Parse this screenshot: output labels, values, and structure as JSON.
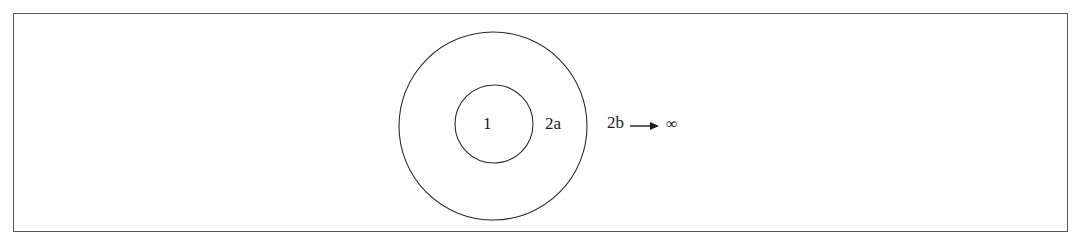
{
  "figure": {
    "type": "concentric-circles-diagram",
    "caption": "",
    "border_color": "#585858",
    "stroke_color": "#2a2a2a",
    "background_color": "#ffffff",
    "text_color": "#1b1b1b"
  },
  "labels": {
    "inner_circle": "1",
    "annulus": "2a",
    "outside": "2b",
    "arrow_icon": "rightwards-arrow",
    "limit": "∞"
  },
  "chart_data": {
    "type": "diagram",
    "title": "",
    "shapes": [
      {
        "name": "inner-circle",
        "kind": "circle",
        "cx": 494,
        "cy": 124,
        "r": 39,
        "label": "1",
        "fill": "none",
        "stroke": "#2a2a2a"
      },
      {
        "name": "outer-circle",
        "kind": "circle",
        "cx": 493,
        "cy": 126,
        "r": 94,
        "label": "2a",
        "fill": "none",
        "stroke": "#2a2a2a"
      }
    ],
    "annotations": [
      {
        "name": "inner-label",
        "text": "1",
        "x": 490,
        "y": 125
      },
      {
        "name": "annulus-label",
        "text": "2a",
        "x": 558,
        "y": 124
      },
      {
        "name": "outer-label",
        "text": "2b",
        "x": 617,
        "y": 124
      },
      {
        "name": "arrow",
        "text": "→",
        "x": 650,
        "y": 124
      },
      {
        "name": "limit-label",
        "text": "∞",
        "x": 678,
        "y": 124
      }
    ],
    "legend": [],
    "grid": false
  }
}
